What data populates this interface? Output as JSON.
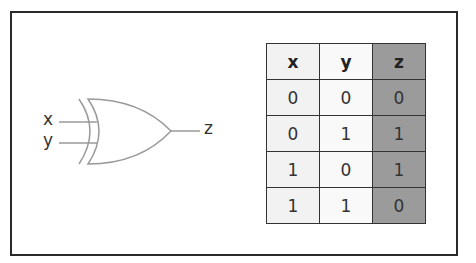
{
  "diagram": {
    "type": "XOR gate with truth table",
    "gate": {
      "name": "XOR",
      "inputs": [
        "x",
        "y"
      ],
      "output": "z"
    },
    "truth_table": {
      "headers": [
        "x",
        "y",
        "z"
      ],
      "rows": [
        [
          "0",
          "0",
          "0"
        ],
        [
          "0",
          "1",
          "1"
        ],
        [
          "1",
          "0",
          "1"
        ],
        [
          "1",
          "1",
          "0"
        ]
      ]
    },
    "colors": {
      "x_column": "#f2f2f2",
      "y_column": "#f9f9f9",
      "z_column": "#9b9b9b",
      "border": "#333333",
      "gate_stroke": "#9a9a9a"
    }
  }
}
